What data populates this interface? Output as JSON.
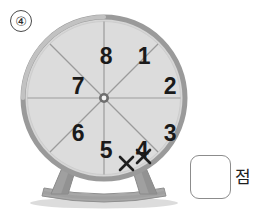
{
  "page": {
    "background_color": "#ffffff",
    "width": 273,
    "height": 218
  },
  "problem": {
    "number_label": "④",
    "number": 4
  },
  "spinner": {
    "name": "eight-sector-spinner-wheel",
    "sector_count": 8,
    "rim_color": "#9a9a9a",
    "face_color": "#d9d9d9",
    "divider_color": "#9b9b9b",
    "hub_color": "#6e6e6e",
    "stand_color": "#9e9e9e",
    "sectors": [
      {
        "index": 1,
        "label": "1",
        "cx": 124,
        "cy": 46,
        "marks": 0
      },
      {
        "index": 2,
        "label": "2",
        "cx": 150,
        "cy": 76,
        "marks": 0
      },
      {
        "index": 3,
        "label": "3",
        "cx": 150,
        "cy": 123,
        "marks": 0
      },
      {
        "index": 4,
        "label": "4",
        "cx": 122,
        "cy": 152,
        "marks": 2
      },
      {
        "index": 5,
        "label": "5",
        "cx": 86,
        "cy": 152,
        "marks": 0
      },
      {
        "index": 6,
        "label": "6",
        "cx": 58,
        "cy": 123,
        "marks": 0
      },
      {
        "index": 7,
        "label": "7",
        "cx": 58,
        "cy": 76,
        "marks": 0
      },
      {
        "index": 8,
        "label": "8",
        "cx": 86,
        "cy": 46,
        "marks": 0
      }
    ],
    "tally_marks": {
      "glyph": "x-mark",
      "count": 2,
      "in_sector_label": "4",
      "color": "#1a1a1a"
    }
  },
  "answer": {
    "box_value": "",
    "box_placeholder": "",
    "unit_label": "점"
  }
}
